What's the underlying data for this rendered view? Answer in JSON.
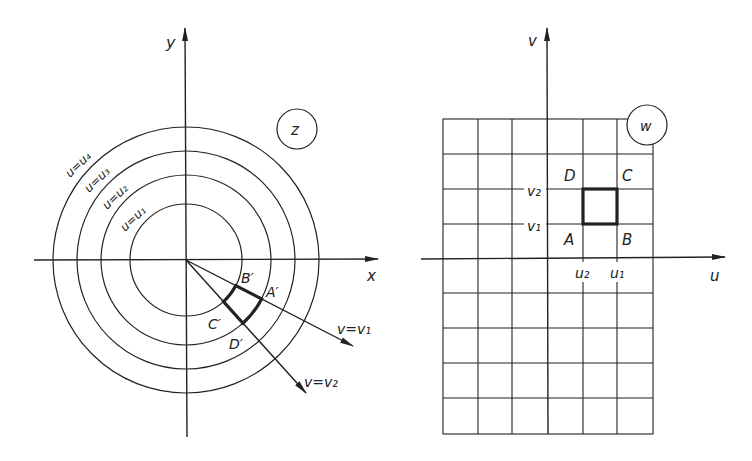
{
  "left_panel": {
    "plane_label": "z",
    "x_axis_label": "x",
    "y_axis_label": "y",
    "circles": [
      {
        "label": "u=u₁",
        "r": 56
      },
      {
        "label": "u=u₂",
        "r": 85
      },
      {
        "label": "u=u₃",
        "r": 109
      },
      {
        "label": "u=u₄",
        "r": 133
      }
    ],
    "rays": [
      {
        "label": "v=v₁"
      },
      {
        "label": "v=v₂"
      }
    ],
    "points": {
      "A": "A′",
      "B": "B′",
      "C": "C′",
      "D": "D′"
    }
  },
  "right_panel": {
    "plane_label": "w",
    "u_axis_label": "u",
    "v_axis_label": "v",
    "ticks": {
      "v1": "v₁",
      "v2": "v₂",
      "u1": "u₁",
      "u2": "u₂"
    },
    "points": {
      "A": "A",
      "B": "B",
      "C": "C",
      "D": "D"
    },
    "grid": {
      "cols": 6,
      "rows": 9
    }
  },
  "colors": {
    "ink": "#222222",
    "background": "#ffffff"
  }
}
